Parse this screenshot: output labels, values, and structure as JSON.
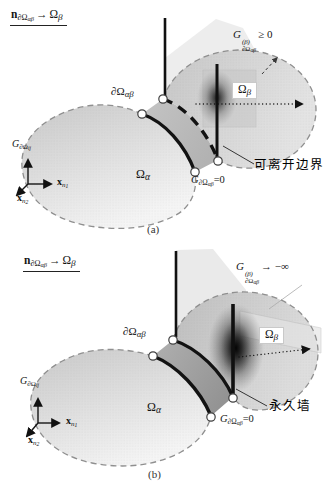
{
  "figure": {
    "background": "#ffffff",
    "colors": {
      "domain_fill_light": "#e3e3e3",
      "interface_band_fill_a": "#bfbfbf",
      "interface_band_fill_b": "#a8a8a8",
      "dark_contact_gradient": "#111111",
      "outline_gray": "#8f8f8f",
      "line_black": "#101010"
    },
    "captions": {
      "a": "(a)",
      "b": "(b)"
    },
    "shared": {
      "normal_condition": {
        "vec": "n",
        "sub_main": "∂Ω",
        "sub_sub": "αβ",
        "arrow": "→",
        "omega": "Ω",
        "omega_sub": "β"
      },
      "boundary_label": {
        "main": "∂Ω",
        "sub": "αβ"
      },
      "omega_alpha": {
        "main": "Ω",
        "sub": "α"
      },
      "omega_beta": {
        "main": "Ω",
        "sub": "β"
      },
      "g_zero": {
        "g": "G",
        "sub": "∂Ω",
        "subsub": "αβ",
        "eq": "=0"
      },
      "axes": {
        "g": {
          "main": "G",
          "sub": "∂Ω",
          "subsub": "ij"
        },
        "x1": {
          "main": "x",
          "sub": "n",
          "subsub": "1"
        },
        "x2": {
          "main": "x",
          "sub": "n",
          "subsub": "2"
        }
      }
    },
    "panel_a": {
      "g_condition": {
        "g": "G",
        "sup": "(β)",
        "sub": "∂Ω",
        "subsub": "αβ",
        "relation": "≥ 0"
      },
      "annotation": "可离开边界"
    },
    "panel_b": {
      "g_condition": {
        "g": "G",
        "sup": "(β)",
        "sub": "∂Ω",
        "subsub": "αβ",
        "relation": "→ −∞"
      },
      "annotation": "永久墙"
    }
  }
}
